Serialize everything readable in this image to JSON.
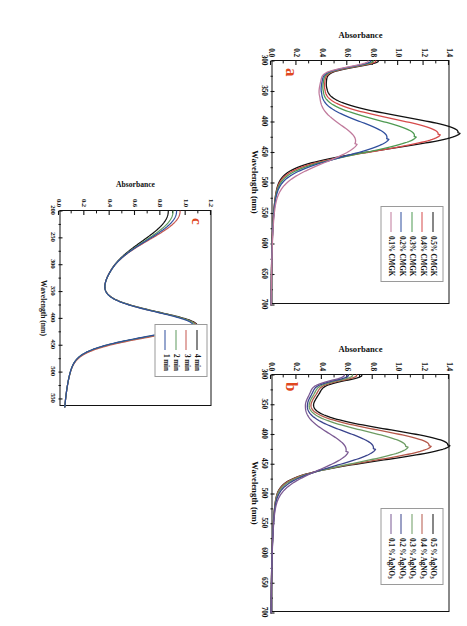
{
  "figure": {
    "type": "multi-panel-spectra",
    "background_color": "#ffffff",
    "panel_letter_color": "#e0481f",
    "orientation_note": "page rotated 90 degrees"
  },
  "panels": [
    {
      "id": "a",
      "letter": "a",
      "legend_title": "",
      "chart_data": {
        "type": "line",
        "title": "",
        "xlabel": "Wavelength (nm)",
        "ylabel": "Absorbance",
        "xlim": [
          300,
          700
        ],
        "ylim": [
          0.0,
          1.4
        ],
        "xticks": [
          300,
          350,
          400,
          450,
          500,
          550,
          600,
          650,
          700
        ],
        "xtick_labels": [
          "300",
          "350",
          "400",
          "450",
          "500",
          "550",
          "600",
          "650",
          "700"
        ],
        "yticks": [
          0.0,
          0.2,
          0.4,
          0.6,
          0.8,
          1.0,
          1.2,
          1.4
        ],
        "ytick_labels": [
          "0.0",
          "0.2",
          "0.4",
          "0.6",
          "0.8",
          "1.0",
          "1.2",
          "1.4"
        ],
        "grid": false,
        "legend_position": "top-right",
        "series": [
          {
            "name": "0.5% CMGK",
            "color": "#111111",
            "peak_x": 418,
            "peak_y": 1.33,
            "shoulder_x": 322,
            "shoulder_y": 0.44,
            "valley_x": 345,
            "valley_y": 0.4,
            "tail_y": 0.045,
            "width": 62
          },
          {
            "name": "0.4% CMGK",
            "color": "#d64b4b",
            "peak_x": 421,
            "peak_y": 1.18,
            "shoulder_x": 322,
            "shoulder_y": 0.43,
            "valley_x": 347,
            "valley_y": 0.39,
            "tail_y": 0.045,
            "width": 63
          },
          {
            "name": "0.3% CMGK",
            "color": "#4f9a52",
            "peak_x": 424,
            "peak_y": 1.0,
            "shoulder_x": 322,
            "shoulder_y": 0.42,
            "valley_x": 349,
            "valley_y": 0.38,
            "tail_y": 0.045,
            "width": 65
          },
          {
            "name": "0.2% CMGK",
            "color": "#2f4f9e",
            "peak_x": 428,
            "peak_y": 0.79,
            "shoulder_x": 322,
            "shoulder_y": 0.41,
            "valley_x": 352,
            "valley_y": 0.37,
            "tail_y": 0.045,
            "width": 68
          },
          {
            "name": "0.1% CMGK",
            "color": "#c07a9c",
            "peak_x": 436,
            "peak_y": 0.55,
            "shoulder_x": 322,
            "shoulder_y": 0.4,
            "valley_x": 358,
            "valley_y": 0.36,
            "tail_y": 0.045,
            "width": 74
          }
        ]
      }
    },
    {
      "id": "b",
      "letter": "b",
      "legend_title": "",
      "chart_data": {
        "type": "line",
        "title": "",
        "xlabel": "Wavelength (nm)",
        "ylabel": "Absorbance",
        "xlim": [
          300,
          700
        ],
        "ylim": [
          0.0,
          1.4
        ],
        "xticks": [
          300,
          350,
          400,
          450,
          500,
          550,
          600,
          650,
          700
        ],
        "xtick_labels": [
          "300",
          "350",
          "400",
          "450",
          "500",
          "550",
          "600",
          "650",
          "700"
        ],
        "yticks": [
          0.0,
          0.2,
          0.4,
          0.6,
          0.8,
          1.0,
          1.2,
          1.4
        ],
        "ytick_labels": [
          "0.0",
          "0.2",
          "0.4",
          "0.6",
          "0.8",
          "1.0",
          "1.2",
          "1.4"
        ],
        "grid": false,
        "legend_position": "top-right",
        "series": [
          {
            "name": "0.5 % AgNO3",
            "name_base": "0.5 % AgNO",
            "name_sub": "3",
            "color": "#111111",
            "peak_x": 418,
            "peak_y": 1.31,
            "shoulder_x": 320,
            "shoulder_y": 0.4,
            "valley_x": 341,
            "valley_y": 0.29,
            "tail_y": 0.05,
            "width": 60
          },
          {
            "name": "0.4 % AgNO3",
            "name_base": "0.4 % AgNO",
            "name_sub": "3",
            "color": "#b5584a",
            "peak_x": 419,
            "peak_y": 1.17,
            "shoulder_x": 320,
            "shoulder_y": 0.38,
            "valley_x": 343,
            "valley_y": 0.27,
            "tail_y": 0.05,
            "width": 61
          },
          {
            "name": "0.3 % AgNO3",
            "name_base": "0.3 % AgNO",
            "name_sub": "3",
            "color": "#6d9c63",
            "peak_x": 421,
            "peak_y": 0.99,
            "shoulder_x": 320,
            "shoulder_y": 0.36,
            "valley_x": 345,
            "valley_y": 0.26,
            "tail_y": 0.05,
            "width": 63
          },
          {
            "name": "0.2 % AgNO3",
            "name_base": "0.2 % AgNO",
            "name_sub": "3",
            "color": "#39438c",
            "peak_x": 424,
            "peak_y": 0.74,
            "shoulder_x": 320,
            "shoulder_y": 0.34,
            "valley_x": 348,
            "valley_y": 0.25,
            "tail_y": 0.05,
            "width": 67
          },
          {
            "name": "0.1 % AgNO3",
            "name_base": "0.1 % AgNO",
            "name_sub": "3",
            "color": "#7b5a93",
            "peak_x": 429,
            "peak_y": 0.53,
            "shoulder_x": 320,
            "shoulder_y": 0.32,
            "valley_x": 352,
            "valley_y": 0.24,
            "tail_y": 0.05,
            "width": 73
          }
        ]
      }
    },
    {
      "id": "c",
      "letter": "c",
      "legend_title": "",
      "chart_data": {
        "type": "line",
        "title": "",
        "xlabel": "Wavelength (nm)",
        "ylabel": "Absorbance",
        "xlim": [
          200,
          565
        ],
        "ylim": [
          0.0,
          1.2
        ],
        "xticks": [
          200,
          250,
          300,
          350,
          400,
          450,
          500,
          550
        ],
        "xtick_labels": [
          "200",
          "250",
          "300",
          "350",
          "400",
          "450",
          "500",
          "550"
        ],
        "yticks": [
          0.0,
          0.2,
          0.4,
          0.6,
          0.8,
          1.0,
          1.2
        ],
        "ytick_labels": [
          "0.0",
          "0.2",
          "0.4",
          "0.6",
          "0.8",
          "1.0",
          "1.2"
        ],
        "grid": false,
        "legend_position": "top-left",
        "series": [
          {
            "name": "4 min",
            "color": "#111111",
            "start_y": 1.1,
            "valley_x": 312,
            "valley_y": 0.585,
            "peak_x": 414,
            "peak_y": 0.93,
            "tail_y": 0.03,
            "width": 60
          },
          {
            "name": "3 min",
            "color": "#c6564e",
            "start_y": 1.2,
            "valley_x": 306,
            "valley_y": 0.6,
            "peak_x": 415,
            "peak_y": 0.93,
            "tail_y": 0.03,
            "width": 61
          },
          {
            "name": "2 min",
            "color": "#5e9a5e",
            "start_y": 1.14,
            "valley_x": 310,
            "valley_y": 0.59,
            "peak_x": 414,
            "peak_y": 0.915,
            "tail_y": 0.03,
            "width": 60
          },
          {
            "name": "1 min",
            "color": "#2f4f9e",
            "start_y": 1.17,
            "valley_x": 308,
            "valley_y": 0.595,
            "peak_x": 414,
            "peak_y": 0.9,
            "tail_y": 0.03,
            "width": 60
          }
        ]
      }
    }
  ]
}
